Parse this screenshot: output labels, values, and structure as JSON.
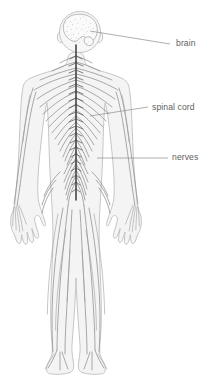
{
  "figure": {
    "width": 212,
    "height": 385,
    "background_color": "#ffffff"
  },
  "colors": {
    "body_fill": "#f4f4f4",
    "body_outline": "#b9b9b9",
    "nerve": "#8e8e8e",
    "spinal_cord": "#3a3a3a",
    "label_text": "#5e5e5e",
    "leader_line": "#8d8d8d"
  },
  "labels": [
    {
      "id": "brain",
      "text": "brain",
      "text_x": 176,
      "text_y": 46,
      "leader": "M 90,31 L 170,44",
      "anatomy": "cerebrum and cerebellum inside the head"
    },
    {
      "id": "spinal-cord",
      "text": "spinal cord",
      "text_x": 152,
      "text_y": 110,
      "leader": "M 90,116 L 148,107",
      "anatomy": "dark vertical cord running down the centre of the torso"
    },
    {
      "id": "nerves",
      "text": "nerves",
      "text_x": 172,
      "text_y": 160,
      "leader": "M 97,158 L 168,158",
      "anatomy": "branching peripheral nerve network"
    }
  ],
  "anatomy_parts": [
    "head",
    "brain",
    "neck",
    "torso",
    "left-arm",
    "right-arm",
    "left-hand",
    "right-hand",
    "left-leg",
    "right-leg",
    "left-foot",
    "right-foot",
    "spinal-cord",
    "peripheral-nerves"
  ]
}
